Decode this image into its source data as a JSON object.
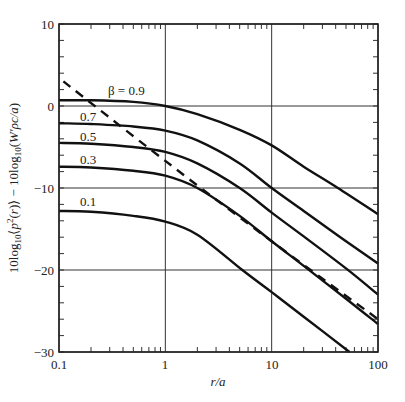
{
  "chart_data": {
    "type": "line",
    "title": "",
    "xlabel": "r/a",
    "ylabel": "10log10⟨p²(r)⟩ − 10log10(W′ρc/a)",
    "xscale": "log",
    "xlim": [
      0.1,
      100
    ],
    "ylim": [
      -30,
      10
    ],
    "grid": true,
    "x_ticks": [
      0.1,
      1,
      10,
      100
    ],
    "x_tick_labels": [
      "0.1",
      "1",
      "10",
      "100"
    ],
    "y_ticks": [
      10,
      0,
      -10,
      -20,
      -30
    ],
    "y_tick_labels": [
      "10",
      "0",
      "−10",
      "−20",
      "−30"
    ],
    "legend": "inline labels",
    "series": [
      {
        "name": "β = 0.9",
        "label": "β = 0.9",
        "style": "solid",
        "x": [
          0.1,
          0.2,
          0.5,
          1,
          2,
          5,
          10,
          20,
          42,
          100
        ],
        "y": [
          0.7,
          0.7,
          0.5,
          0.0,
          -1.0,
          -2.9,
          -4.8,
          -7.4,
          -10.0,
          -13.2
        ]
      },
      {
        "name": "β = 0.7",
        "label": "0.7",
        "style": "solid",
        "x": [
          0.1,
          0.2,
          0.5,
          1,
          2,
          5,
          10,
          20,
          50,
          100
        ],
        "y": [
          -2.1,
          -2.2,
          -2.5,
          -3.0,
          -4.2,
          -7.0,
          -10.0,
          -12.8,
          -16.5,
          -19.2
        ]
      },
      {
        "name": "β = 0.5",
        "label": "0.5",
        "style": "solid",
        "x": [
          0.1,
          0.2,
          0.5,
          1,
          2,
          5,
          10,
          20,
          50,
          100
        ],
        "y": [
          -4.5,
          -4.6,
          -5.0,
          -5.6,
          -7.0,
          -10.0,
          -13.0,
          -15.9,
          -19.8,
          -23.0
        ]
      },
      {
        "name": "β = 0.3",
        "label": "0.3",
        "style": "solid",
        "x": [
          0.1,
          0.2,
          0.5,
          1,
          2,
          5,
          10,
          20,
          50,
          100
        ],
        "y": [
          -7.4,
          -7.5,
          -7.9,
          -8.5,
          -10.0,
          -13.4,
          -16.5,
          -19.5,
          -23.5,
          -26.6
        ]
      },
      {
        "name": "β = 0.1",
        "label": "0.1",
        "style": "solid",
        "x": [
          0.1,
          0.2,
          0.5,
          1,
          2,
          5.3,
          10,
          20,
          54
        ],
        "y": [
          -12.8,
          -12.9,
          -13.4,
          -14.1,
          -15.7,
          -20.0,
          -22.7,
          -25.7,
          -30.0
        ]
      },
      {
        "name": "far-field asymptote",
        "label": "",
        "style": "dashed",
        "x": [
          0.11,
          1,
          10,
          100
        ],
        "y": [
          3.0,
          -6.7,
          -16.5,
          -26.0
        ]
      }
    ]
  },
  "labels": {
    "beta_09": "β = 0.9",
    "beta_07": "0.7",
    "beta_05": "0.5",
    "beta_03": "0.3",
    "beta_01": "0.1",
    "xlabel": "r/a",
    "tick_x_0": "0.1",
    "tick_x_1": "1",
    "tick_x_2": "10",
    "tick_x_3": "100",
    "tick_y_0": "10",
    "tick_y_1": "0",
    "tick_y_2": "−10",
    "tick_y_3": "−20",
    "tick_y_4": "−30"
  }
}
